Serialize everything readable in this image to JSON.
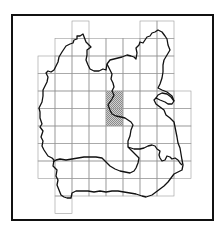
{
  "figure": {
    "type": "grid-map",
    "frame": {
      "x": 12,
      "y": 15,
      "width": 201,
      "height": 205,
      "stroke": "#111111",
      "stroke_width": 2
    },
    "grid": {
      "cell_w": 17,
      "cell_h": 17.5,
      "origin_x": 38,
      "origin_y": 21,
      "stroke": "#9a9a9a",
      "rows": [
        {
          "row": 0,
          "cols": [
            2,
            6,
            7
          ]
        },
        {
          "row": 1,
          "cols": [
            1,
            2,
            3,
            4,
            5,
            6,
            7
          ]
        },
        {
          "row": 2,
          "cols": [
            0,
            1,
            2,
            3,
            4,
            5,
            6,
            7
          ]
        },
        {
          "row": 3,
          "cols": [
            0,
            1,
            2,
            3,
            4,
            5,
            6,
            7
          ]
        },
        {
          "row": 4,
          "cols": [
            0,
            1,
            2,
            3,
            4,
            5,
            6,
            7,
            8
          ]
        },
        {
          "row": 5,
          "cols": [
            0,
            1,
            2,
            3,
            4,
            5,
            6,
            7,
            8
          ]
        },
        {
          "row": 6,
          "cols": [
            0,
            1,
            2,
            3,
            4,
            5,
            6,
            7,
            8
          ]
        },
        {
          "row": 7,
          "cols": [
            0,
            1,
            2,
            3,
            4,
            5,
            6,
            7,
            8
          ]
        },
        {
          "row": 8,
          "cols": [
            0,
            1,
            2,
            3,
            4,
            5,
            6,
            7,
            8
          ]
        },
        {
          "row": 9,
          "cols": [
            1,
            2,
            3,
            4,
            5,
            6,
            7
          ]
        },
        {
          "row": 10,
          "cols": [
            1
          ]
        }
      ],
      "highlighted_cells": [
        {
          "row": 4,
          "col": 4
        },
        {
          "row": 5,
          "col": 4
        }
      ],
      "highlight_fill": "#b8b8b8"
    },
    "boundary_stroke": "#111111"
  }
}
